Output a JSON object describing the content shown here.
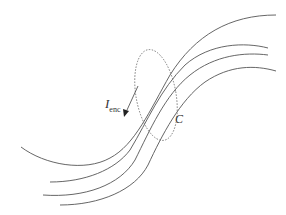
{
  "diagram": {
    "labels": {
      "current_main": "I",
      "current_sub": "enc",
      "loop": "C"
    },
    "elements": {
      "field_lines": 4,
      "loop_style": "dashed ellipse",
      "current_arrow": "pointing down-left along innermost line"
    },
    "colors": {
      "line": "#555555",
      "loop": "#777777",
      "background": "#ffffff"
    }
  }
}
